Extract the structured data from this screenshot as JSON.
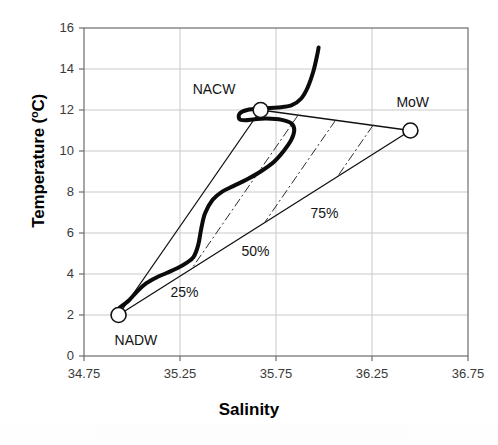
{
  "chart_data": {
    "type": "scatter",
    "title": "",
    "xlabel": "Salinity",
    "ylabel": "Temperature (oC)",
    "ylabel_plain": "Temperature (°C)",
    "xlim": [
      34.75,
      36.75
    ],
    "ylim": [
      0,
      16
    ],
    "grid": true,
    "legend_position": "none",
    "xticks": [
      "34.75",
      "35.25",
      "35.75",
      "36.25",
      "36.75"
    ],
    "xtick_values": [
      34.75,
      35.25,
      35.75,
      36.25,
      36.75
    ],
    "yticks": [
      "0",
      "2",
      "4",
      "6",
      "8",
      "10",
      "12",
      "14",
      "16"
    ],
    "ytick_values": [
      0,
      2,
      4,
      6,
      8,
      10,
      12,
      14,
      16
    ],
    "endmembers": [
      {
        "name": "NADW",
        "salinity": 34.93,
        "temperature": 2.0,
        "label_dx": -4,
        "label_dy": 26
      },
      {
        "name": "NACW",
        "salinity": 35.67,
        "temperature": 12.0,
        "label_dx": -68,
        "label_dy": -20
      },
      {
        "name": "MoW",
        "salinity": 36.45,
        "temperature": 11.0,
        "label_dx": -14,
        "label_dy": -28
      }
    ],
    "mixing_triangle_edges": [
      {
        "from": "NADW",
        "to": "NACW",
        "style": "solid"
      },
      {
        "from": "NACW",
        "to": "MoW",
        "style": "solid"
      },
      {
        "from": "NADW",
        "to": "MoW",
        "style": "solid"
      }
    ],
    "mixing_isolines": [
      {
        "label": "25%",
        "fraction": 0.25,
        "style": "dash-dot",
        "label_salinity": 35.2,
        "label_temperature": 3.05
      },
      {
        "label": "50%",
        "fraction": 0.5,
        "style": "dash-dot",
        "label_salinity": 35.57,
        "label_temperature": 5.05
      },
      {
        "label": "75%",
        "fraction": 0.75,
        "style": "dash-dot",
        "label_salinity": 35.93,
        "label_temperature": 6.95
      }
    ],
    "series": [
      {
        "name": "observed T-S profile",
        "style": "thick-solid",
        "points": [
          [
            34.935,
            2.35
          ],
          [
            34.955,
            2.5
          ],
          [
            34.985,
            2.72
          ],
          [
            35.03,
            3.18
          ],
          [
            35.075,
            3.55
          ],
          [
            35.125,
            3.82
          ],
          [
            35.18,
            4.05
          ],
          [
            35.235,
            4.28
          ],
          [
            35.28,
            4.52
          ],
          [
            35.32,
            4.82
          ],
          [
            35.345,
            5.42
          ],
          [
            35.36,
            6.18
          ],
          [
            35.38,
            6.95
          ],
          [
            35.42,
            7.62
          ],
          [
            35.47,
            8.02
          ],
          [
            35.53,
            8.3
          ],
          [
            35.6,
            8.62
          ],
          [
            35.67,
            9.0
          ],
          [
            35.74,
            9.48
          ],
          [
            35.79,
            10.0
          ],
          [
            35.83,
            10.55
          ],
          [
            35.845,
            11.02
          ],
          [
            35.83,
            11.35
          ],
          [
            35.78,
            11.52
          ],
          [
            35.7,
            11.58
          ],
          [
            35.64,
            11.55
          ],
          [
            35.59,
            11.5
          ],
          [
            35.56,
            11.55
          ],
          [
            35.56,
            11.82
          ],
          [
            35.6,
            12.0
          ],
          [
            35.68,
            12.08
          ],
          [
            35.76,
            12.12
          ],
          [
            35.83,
            12.22
          ],
          [
            35.88,
            12.55
          ],
          [
            35.915,
            13.1
          ],
          [
            35.945,
            13.9
          ],
          [
            35.965,
            14.7
          ],
          [
            35.972,
            15.05
          ]
        ]
      }
    ]
  },
  "plot_geometry": {
    "left": 84,
    "right": 468,
    "top": 28,
    "bottom": 356
  }
}
